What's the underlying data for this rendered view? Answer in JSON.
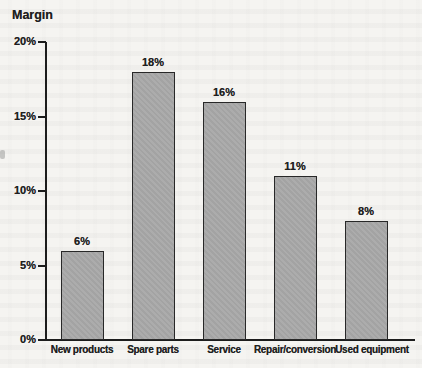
{
  "page": {
    "background_color": "#f5f4f1"
  },
  "chart_data": {
    "type": "bar",
    "title": "Margin",
    "categories": [
      "New products",
      "Spare parts",
      "Service",
      "Repair/conversion",
      "Used equipment"
    ],
    "values": [
      6,
      18,
      16,
      11,
      8
    ],
    "value_labels": [
      "6%",
      "18%",
      "16%",
      "11%",
      "8%"
    ],
    "xlabel": "",
    "ylabel": "Margin",
    "ylim": [
      0,
      20
    ],
    "yticks": [
      0,
      5,
      10,
      15,
      20
    ],
    "ytick_labels": [
      "0%",
      "5%",
      "10%",
      "15%",
      "20%"
    ],
    "grid": false,
    "legend": "none",
    "bar_color": "#a8a8a8",
    "bar_border_color": "#282828",
    "axis_color": "#1c1c1c",
    "text_color": "#1f1f1f"
  }
}
